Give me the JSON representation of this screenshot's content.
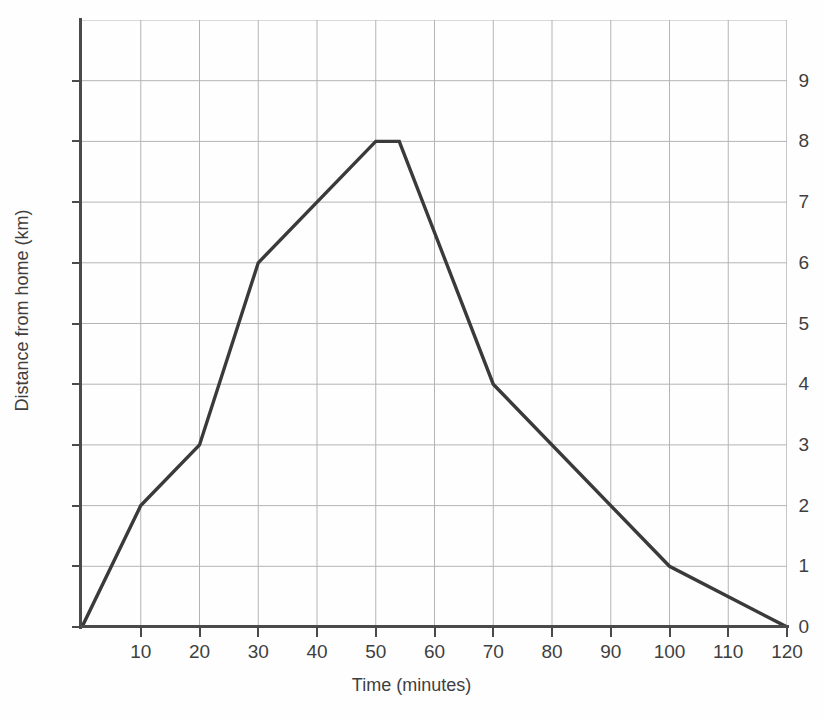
{
  "figure": {
    "title_fragment": "",
    "background_color": "#fefefe",
    "line_color": "#3a3a3a",
    "grid_color": "#b4b4b4",
    "axis_color": "#4a4a4a"
  },
  "chart_data": {
    "type": "line",
    "title": "",
    "xlabel": "Time (minutes)",
    "ylabel": "Distance from home (km)",
    "xlim": [
      0,
      120
    ],
    "ylim": [
      0,
      10
    ],
    "grid": true,
    "legend": "none",
    "x_ticks": [
      0,
      10,
      20,
      30,
      40,
      50,
      60,
      70,
      80,
      90,
      100,
      110,
      120
    ],
    "x_tick_labels": [
      "",
      "10",
      "20",
      "30",
      "40",
      "50",
      "60",
      "70",
      "80",
      "90",
      "100",
      "110",
      "120"
    ],
    "y_ticks": [
      0,
      1,
      2,
      3,
      4,
      5,
      6,
      7,
      8,
      9
    ],
    "y_tick_labels": [
      "0",
      "1",
      "2",
      "3",
      "4",
      "5",
      "6",
      "7",
      "8",
      "9"
    ],
    "series": [
      {
        "name": "Journey",
        "x": [
          0,
          10,
          20,
          30,
          50,
          54,
          70,
          100,
          120
        ],
        "y": [
          0,
          2,
          3,
          6,
          8,
          8,
          4,
          1,
          0
        ],
        "points": [
          {
            "x": 0,
            "y": 0
          },
          {
            "x": 10,
            "y": 2
          },
          {
            "x": 20,
            "y": 3
          },
          {
            "x": 30,
            "y": 6
          },
          {
            "x": 50,
            "y": 8
          },
          {
            "x": 54,
            "y": 8
          },
          {
            "x": 70,
            "y": 4
          },
          {
            "x": 100,
            "y": 1
          },
          {
            "x": 120,
            "y": 0
          }
        ]
      }
    ]
  }
}
